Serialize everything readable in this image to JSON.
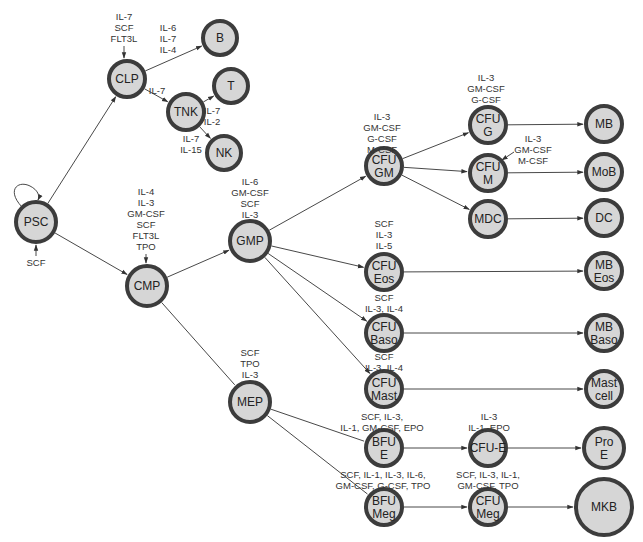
{
  "diagram": {
    "type": "hematopoiesis-lineage-tree",
    "nodes": [
      {
        "id": "PSC",
        "lines": [
          "PSC"
        ],
        "x": 36,
        "y": 222,
        "r": 20
      },
      {
        "id": "CLP",
        "lines": [
          "CLP"
        ],
        "x": 127,
        "y": 79,
        "r": 18
      },
      {
        "id": "B",
        "lines": [
          "B"
        ],
        "x": 220,
        "y": 38,
        "r": 17
      },
      {
        "id": "T",
        "lines": [
          "T"
        ],
        "x": 231,
        "y": 86,
        "r": 17
      },
      {
        "id": "TNK",
        "lines": [
          "TNK"
        ],
        "x": 186,
        "y": 112,
        "r": 18
      },
      {
        "id": "NK",
        "lines": [
          "NK"
        ],
        "x": 224,
        "y": 153,
        "r": 17
      },
      {
        "id": "CMP",
        "lines": [
          "CMP"
        ],
        "x": 147,
        "y": 286,
        "r": 20
      },
      {
        "id": "GMP",
        "lines": [
          "GMP"
        ],
        "x": 250,
        "y": 241,
        "r": 20
      },
      {
        "id": "CFU-GM",
        "lines": [
          "CFU",
          "GM"
        ],
        "x": 384,
        "y": 166,
        "r": 18
      },
      {
        "id": "CFU-G",
        "lines": [
          "CFU",
          "G"
        ],
        "x": 488,
        "y": 125,
        "r": 18
      },
      {
        "id": "CFU-M",
        "lines": [
          "CFU",
          "M"
        ],
        "x": 488,
        "y": 173,
        "r": 18
      },
      {
        "id": "MDC",
        "lines": [
          "MDC"
        ],
        "x": 488,
        "y": 219,
        "r": 18
      },
      {
        "id": "MB",
        "lines": [
          "MB"
        ],
        "x": 604,
        "y": 124,
        "r": 18
      },
      {
        "id": "MoB",
        "lines": [
          "MoB"
        ],
        "x": 604,
        "y": 172,
        "r": 18
      },
      {
        "id": "DC",
        "lines": [
          "DC"
        ],
        "x": 604,
        "y": 218,
        "r": 18
      },
      {
        "id": "CFU-Eos",
        "lines": [
          "CFU",
          "Eos"
        ],
        "x": 384,
        "y": 272,
        "r": 18
      },
      {
        "id": "MB-Eos",
        "lines": [
          "MB",
          "Eos"
        ],
        "x": 604,
        "y": 271,
        "r": 18
      },
      {
        "id": "CFU-Baso",
        "lines": [
          "CFU",
          "Baso"
        ],
        "x": 384,
        "y": 333,
        "r": 18
      },
      {
        "id": "MB-Baso",
        "lines": [
          "MB",
          "Baso"
        ],
        "x": 604,
        "y": 333,
        "r": 18
      },
      {
        "id": "CFU-Mast",
        "lines": [
          "CFU",
          "Mast"
        ],
        "x": 384,
        "y": 389,
        "r": 18
      },
      {
        "id": "Mast-cell",
        "lines": [
          "Mast",
          "cell"
        ],
        "x": 604,
        "y": 389,
        "r": 18
      },
      {
        "id": "MEP",
        "lines": [
          "MEP"
        ],
        "x": 250,
        "y": 402,
        "r": 20
      },
      {
        "id": "BFU-E",
        "lines": [
          "BFU",
          "E"
        ],
        "x": 384,
        "y": 448,
        "r": 18
      },
      {
        "id": "CFU-E",
        "lines": [
          "CFU-E"
        ],
        "x": 488,
        "y": 448,
        "r": 18
      },
      {
        "id": "Pro-E",
        "lines": [
          "Pro",
          "E"
        ],
        "x": 604,
        "y": 448,
        "r": 20
      },
      {
        "id": "BFU-Meg",
        "lines": [
          "BFU",
          "Meg"
        ],
        "x": 384,
        "y": 507,
        "r": 18
      },
      {
        "id": "CFU-Meg",
        "lines": [
          "CFU",
          "Meg"
        ],
        "x": 488,
        "y": 507,
        "r": 18
      },
      {
        "id": "MKB",
        "lines": [
          "MKB"
        ],
        "x": 604,
        "y": 507,
        "r": 28
      }
    ],
    "edges": [
      {
        "from": "PSC",
        "to": "CLP"
      },
      {
        "from": "PSC",
        "to": "CMP"
      },
      {
        "from": "CLP",
        "to": "B"
      },
      {
        "from": "CLP",
        "to": "TNK"
      },
      {
        "from": "TNK",
        "to": "T"
      },
      {
        "from": "TNK",
        "to": "NK"
      },
      {
        "from": "CMP",
        "to": "GMP"
      },
      {
        "from": "CMP",
        "to": "MEP",
        "arrow": false
      },
      {
        "from": "GMP",
        "to": "CFU-GM"
      },
      {
        "from": "GMP",
        "to": "CFU-Eos"
      },
      {
        "from": "GMP",
        "to": "CFU-Baso"
      },
      {
        "from": "GMP",
        "to": "CFU-Mast"
      },
      {
        "from": "CFU-GM",
        "to": "CFU-G"
      },
      {
        "from": "CFU-GM",
        "to": "CFU-M"
      },
      {
        "from": "CFU-GM",
        "to": "MDC"
      },
      {
        "from": "CFU-G",
        "to": "MB"
      },
      {
        "from": "CFU-M",
        "to": "MoB"
      },
      {
        "from": "MDC",
        "to": "DC"
      },
      {
        "from": "CFU-Eos",
        "to": "MB-Eos"
      },
      {
        "from": "CFU-Baso",
        "to": "MB-Baso"
      },
      {
        "from": "CFU-Mast",
        "to": "Mast-cell"
      },
      {
        "from": "MEP",
        "to": "BFU-E",
        "arrow": false
      },
      {
        "from": "MEP",
        "to": "BFU-Meg",
        "arrow": false
      },
      {
        "from": "BFU-E",
        "to": "CFU-E"
      },
      {
        "from": "CFU-E",
        "to": "Pro-E"
      },
      {
        "from": "BFU-Meg",
        "to": "CFU-Meg"
      },
      {
        "from": "CFU-Meg",
        "to": "MKB"
      }
    ],
    "cytokine_labels": [
      {
        "target": "CLP",
        "lines": [
          "IL-7",
          "SCF",
          "FLT3L"
        ],
        "x": 124,
        "y": 20,
        "arrow_down": true
      },
      {
        "target": "B",
        "lines": [
          "IL-6",
          "IL-7",
          "IL-4"
        ],
        "x": 168,
        "y": 31
      },
      {
        "target": "TNK",
        "lines": [
          "IL-7"
        ],
        "x": 157,
        "y": 94
      },
      {
        "target": "T",
        "lines": [
          "IL-7",
          "IL-2"
        ],
        "x": 212,
        "y": 114
      },
      {
        "target": "NK",
        "lines": [
          "IL-7",
          "IL-15"
        ],
        "x": 191,
        "y": 142
      },
      {
        "target": "PSC",
        "lines": [
          "SCF"
        ],
        "x": 36,
        "y": 266,
        "arrow_up": true
      },
      {
        "target": "CMP",
        "lines": [
          "IL-4",
          "IL-3",
          "GM-CSF",
          "SCF",
          "FLT3L",
          "TPO"
        ],
        "x": 146,
        "y": 195,
        "arrow_down": true
      },
      {
        "target": "GMP",
        "lines": [
          "IL-6",
          "GM-CSF",
          "SCF",
          "IL-3"
        ],
        "x": 250,
        "y": 185
      },
      {
        "target": "CFU-GM",
        "lines": [
          "IL-3",
          "GM-CSF",
          "G-CSF",
          "M-CSF"
        ],
        "x": 382,
        "y": 120
      },
      {
        "target": "CFU-G",
        "lines": [
          "IL-3",
          "GM-CSF",
          "G-CSF"
        ],
        "x": 486,
        "y": 81
      },
      {
        "target": "CFU-M",
        "lines": [
          "IL-3",
          "GM-CSF",
          "M-CSF"
        ],
        "x": 533,
        "y": 142
      },
      {
        "target": "CFU-Eos",
        "lines": [
          "SCF",
          "IL-3",
          "IL-5"
        ],
        "x": 384,
        "y": 227
      },
      {
        "target": "CFU-Baso",
        "lines": [
          "SCF",
          "IL-3, IL-4"
        ],
        "x": 384,
        "y": 301
      },
      {
        "target": "CFU-Mast",
        "lines": [
          "SCF",
          "IL-3, IL-4"
        ],
        "x": 384,
        "y": 360
      },
      {
        "target": "MEP",
        "lines": [
          "SCF",
          "TPO",
          "IL-3"
        ],
        "x": 250,
        "y": 356
      },
      {
        "target": "BFU-E",
        "lines": [
          "SCF, IL-3,",
          "IL-1, GM-CSF, EPO"
        ],
        "x": 382,
        "y": 420
      },
      {
        "target": "CFU-E",
        "lines": [
          "IL-3",
          "IL-1, EPO"
        ],
        "x": 489,
        "y": 420
      },
      {
        "target": "BFU-Meg",
        "lines": [
          "SCF, IL-1, IL-3, IL-6,",
          "GM-CSF, G-CSF, TPO"
        ],
        "x": 383,
        "y": 478
      },
      {
        "target": "CFU-Meg",
        "lines": [
          "SCF, IL-3, IL-1,",
          "GM-CSF, TPO"
        ],
        "x": 488,
        "y": 478
      }
    ],
    "colors": {
      "node_fill": "#d6d6d6",
      "node_stroke": "#3c3c3c",
      "edge": "#333333",
      "text": "#222222",
      "background": "#ffffff"
    }
  }
}
